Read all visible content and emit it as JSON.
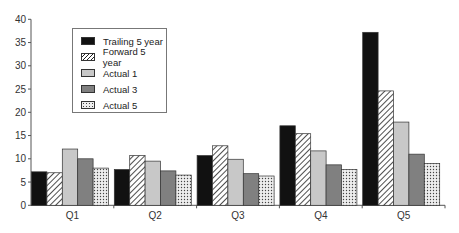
{
  "chart_data": {
    "type": "bar",
    "title": "",
    "xlabel": "",
    "ylabel": "",
    "categories": [
      "Q1",
      "Q2",
      "Q3",
      "Q4",
      "Q5"
    ],
    "series": [
      {
        "name": "Trailing 5 year",
        "values": [
          7.2,
          7.7,
          10.7,
          17.1,
          37.2
        ],
        "fill": "#111111",
        "pattern": "solid"
      },
      {
        "name": "Forward 5 year",
        "values": [
          7.0,
          10.7,
          12.8,
          15.4,
          24.6
        ],
        "fill": "#ffffff",
        "pattern": "diagonal-hatch"
      },
      {
        "name": "Actual 1",
        "values": [
          12.1,
          9.5,
          9.9,
          11.7,
          17.9
        ],
        "fill": "#c8c8c8",
        "pattern": "solid"
      },
      {
        "name": "Actual 3",
        "values": [
          10.0,
          7.4,
          6.8,
          8.7,
          11.0
        ],
        "fill": "#808080",
        "pattern": "solid"
      },
      {
        "name": "Actual 5",
        "values": [
          8.0,
          6.5,
          6.3,
          7.7,
          9.0
        ],
        "fill": "#e6e6e6",
        "pattern": "dots"
      }
    ],
    "ylim": [
      0,
      40
    ],
    "yticks": [
      0,
      5,
      10,
      15,
      20,
      25,
      30,
      35,
      40
    ],
    "grid": false,
    "legend_position": "upper-left-inside"
  }
}
